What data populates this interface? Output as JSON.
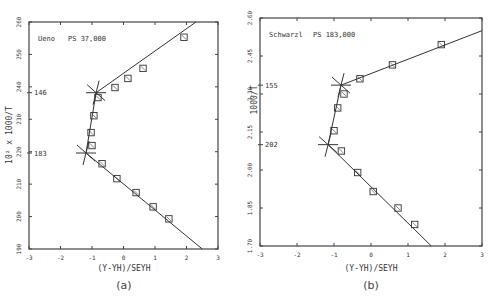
{
  "chart_data": [
    {
      "type": "scatter",
      "panel_caption": "(a)",
      "annotation": "Ueno    PS 37,000",
      "xlabel": "(Y-YH)/SEYH",
      "ylabel": "10² x 1000/T",
      "xlim": [
        -3,
        3
      ],
      "ylim": [
        190,
        260
      ],
      "xticks": [
        "-3",
        "-2",
        "-1",
        "0",
        "1",
        "2",
        "3"
      ],
      "yticks": [
        "190",
        "200",
        "210",
        "220",
        "230",
        "240",
        "250",
        "260"
      ],
      "grid": false,
      "transition_markers": [
        {
          "label": "146",
          "x": -0.87,
          "y": 238.2
        },
        {
          "label": "183",
          "x": -1.19,
          "y": 219.6
        }
      ],
      "points": [
        {
          "x": 1.92,
          "y": 255.3
        },
        {
          "x": 0.62,
          "y": 245.7
        },
        {
          "x": 0.14,
          "y": 242.6
        },
        {
          "x": -0.27,
          "y": 239.8
        },
        {
          "x": -0.81,
          "y": 236.7
        },
        {
          "x": -0.94,
          "y": 231.1
        },
        {
          "x": -1.03,
          "y": 225.9
        },
        {
          "x": -1.0,
          "y": 221.9
        },
        {
          "x": -0.68,
          "y": 216.3
        },
        {
          "x": -0.21,
          "y": 211.7
        },
        {
          "x": 0.4,
          "y": 207.4
        },
        {
          "x": 0.94,
          "y": 203.0
        },
        {
          "x": 1.44,
          "y": 199.3
        }
      ],
      "fit_lines": [
        {
          "from": {
            "x": -1.19,
            "y": 219.6
          },
          "to": {
            "x": -0.87,
            "y": 238.2
          }
        },
        {
          "from": {
            "x": -0.87,
            "y": 238.2
          },
          "to": {
            "x": 2.3,
            "y": 260
          }
        },
        {
          "from": {
            "x": -1.19,
            "y": 219.6
          },
          "to": {
            "x": 2.5,
            "y": 190
          }
        }
      ]
    },
    {
      "type": "scatter",
      "panel_caption": "(b)",
      "annotation": "Schwarzl    PS 183,000",
      "xlabel": "(Y-YH)/SEYH",
      "ylabel": "1000/T",
      "xlim": [
        -3,
        3
      ],
      "ylim": [
        1.7,
        2.6
      ],
      "xticks": [
        "-3",
        "-2",
        "-1",
        "0",
        "1",
        "2",
        "3"
      ],
      "yticks": [
        "1.70",
        "1.85",
        "2.00",
        "2.15",
        "2.30",
        "2.45",
        "2.60"
      ],
      "grid": false,
      "transition_markers": [
        {
          "label": "155",
          "x": -0.81,
          "y": 2.335
        },
        {
          "label": "202",
          "x": -1.16,
          "y": 2.1
        }
      ],
      "points": [
        {
          "x": 1.9,
          "y": 2.495
        },
        {
          "x": 0.58,
          "y": 2.415
        },
        {
          "x": -0.3,
          "y": 2.36
        },
        {
          "x": -0.73,
          "y": 2.3
        },
        {
          "x": -0.9,
          "y": 2.245
        },
        {
          "x": -1.0,
          "y": 2.155
        },
        {
          "x": -0.8,
          "y": 2.075
        },
        {
          "x": -0.36,
          "y": 1.99
        },
        {
          "x": 0.06,
          "y": 1.915
        },
        {
          "x": 0.73,
          "y": 1.85
        },
        {
          "x": 1.18,
          "y": 1.785
        }
      ],
      "fit_lines": [
        {
          "from": {
            "x": -1.16,
            "y": 2.1
          },
          "to": {
            "x": -0.81,
            "y": 2.335
          }
        },
        {
          "from": {
            "x": -0.81,
            "y": 2.335
          },
          "to": {
            "x": 3.0,
            "y": 2.55
          }
        },
        {
          "from": {
            "x": -1.16,
            "y": 2.1
          },
          "to": {
            "x": 1.63,
            "y": 1.7
          }
        }
      ]
    }
  ],
  "panels": {
    "a": {
      "annotation_name": "Ueno",
      "annotation_ps": "PS 37,000",
      "ylabel": "10² x 1000/T",
      "xlabel": "(Y-YH)/SEYH",
      "caption": "(a)",
      "marker1": "146",
      "marker2": "183"
    },
    "b": {
      "annotation_name": "Schwarzl",
      "annotation_ps": "PS 183,000",
      "ylabel": "1000/T",
      "xlabel": "(Y-YH)/SEYH",
      "caption": "(b)",
      "marker1": "155",
      "marker2": "202"
    }
  },
  "colors": {
    "ink": "#333333",
    "background": "#ffffff"
  }
}
